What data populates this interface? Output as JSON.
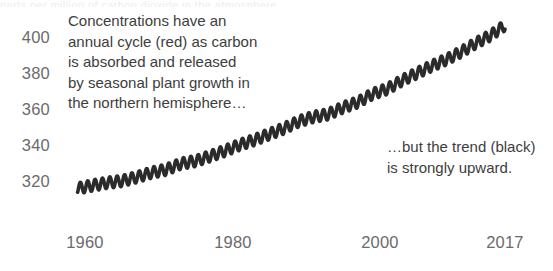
{
  "figure": {
    "top_crop_remnant": "parts per million of carbon dioxide in the atmosphere",
    "background_color": "#ffffff",
    "axis_label_color": "#6b6b6b",
    "annotation_color": "#3d3d3d",
    "series_color": "#2b2b2b"
  },
  "annotations": {
    "cycle": [
      "Concentrations have an",
      "annual cycle (red) as carbon",
      "is absorbed and released",
      "by seasonal plant growth in",
      "the northern hemisphere…"
    ],
    "trend": [
      "…but the trend (black)",
      "is strongly upward."
    ]
  },
  "chart_data": {
    "type": "line",
    "title": "",
    "xlabel": "",
    "ylabel": "",
    "grid": false,
    "legend": "none",
    "xlim": [
      1958.5,
      2018.2
    ],
    "ylim": [
      310,
      412
    ],
    "x_ticks": [
      1960,
      1980,
      2000,
      2017
    ],
    "x_tick_labels": [
      "1960",
      "1980",
      "2000",
      "2017"
    ],
    "y_ticks": [
      320,
      340,
      360,
      380,
      400
    ],
    "y_tick_labels": [
      "320",
      "340",
      "360",
      "380",
      "400"
    ],
    "series": [
      {
        "name": "annual cycle",
        "color": "#e03123",
        "description": "monthly CO2 with seasonal sawtooth oscillation, amplitude about 3 ppm peak-to-trough half-range, peak in May, trough in September",
        "seasonal_amplitude_ppm": 3.1
      },
      {
        "name": "trend",
        "color": "#2b2b2b",
        "description": "smooth accelerating upward trend through the seasonal cycle",
        "x": [
          1959,
          1961,
          1963,
          1965,
          1967,
          1969,
          1971,
          1973,
          1975,
          1977,
          1979,
          1981,
          1983,
          1985,
          1987,
          1989,
          1991,
          1993,
          1995,
          1997,
          1999,
          2001,
          2003,
          2005,
          2007,
          2009,
          2011,
          2013,
          2015,
          2017
        ],
        "values": [
          315.9,
          317.5,
          319.0,
          320.0,
          322.1,
          324.6,
          326.3,
          329.6,
          331.1,
          333.8,
          336.8,
          340.1,
          342.8,
          346.0,
          349.2,
          353.1,
          355.6,
          357.1,
          360.8,
          363.7,
          368.3,
          371.1,
          375.8,
          379.8,
          383.8,
          387.4,
          391.6,
          396.5,
          400.8,
          406.5
        ]
      }
    ]
  }
}
